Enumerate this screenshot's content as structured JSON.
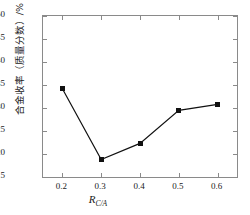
{
  "chart_data": {
    "type": "line",
    "title": "",
    "xlabel": "R_C/A",
    "xlabel_base": "R",
    "xlabel_sub": "C/A",
    "ylabel": "合金收率（质量分数）/%",
    "x": [
      0.2,
      0.3,
      0.4,
      0.5,
      0.6
    ],
    "values": [
      34.2,
      18.8,
      22.3,
      29.5,
      30.8
    ],
    "series": [
      {
        "name": "合金收率",
        "values": [
          34.2,
          18.8,
          22.3,
          29.5,
          30.8
        ]
      }
    ],
    "xlim": [
      0.15,
      0.65
    ],
    "ylim": [
      15,
      50
    ],
    "xticks": [
      0.2,
      0.3,
      0.4,
      0.5,
      0.6
    ],
    "xtick_labels": [
      "0.2",
      "0.3",
      "0.4",
      "0.5",
      "0.6"
    ],
    "yticks": [
      15,
      20,
      25,
      30,
      35,
      40,
      45,
      50
    ],
    "ytick_labels": [
      "15",
      "20",
      "25",
      "30",
      "35",
      "40",
      "45",
      "50"
    ],
    "grid": false,
    "legend": null,
    "marker": "square",
    "line_color": "#111111",
    "marker_color": "#111111",
    "axis_color": "#8a8a8a"
  }
}
